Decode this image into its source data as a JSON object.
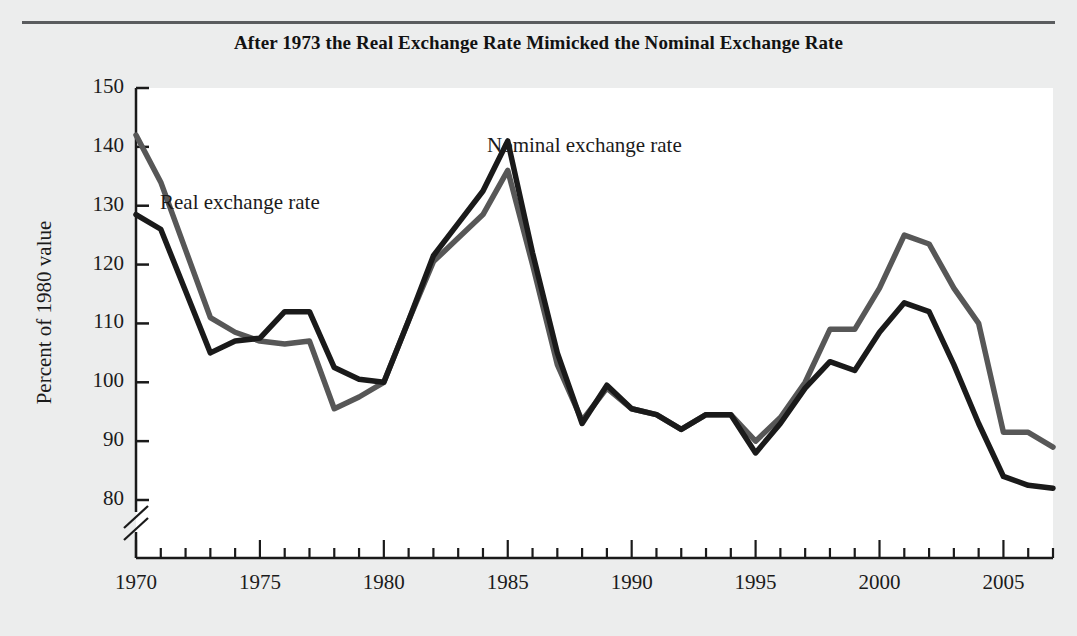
{
  "figure": {
    "title": "After 1973 the Real Exchange Rate Mimicked the Nominal Exchange Rate",
    "background_color": "#eceded",
    "plot_background_color": "#ffffff",
    "rule_color": "#5a5c5e"
  },
  "annotations": {
    "real_label": "Real exchange rate",
    "nominal_label": "Nominal exchange rate"
  },
  "chart_data": {
    "type": "line",
    "title": "After 1973 the Real Exchange Rate Mimicked the Nominal Exchange Rate",
    "xlabel": "",
    "ylabel": "Percent of 1980 value",
    "xlim": [
      1970,
      2007
    ],
    "ylim": [
      75,
      150
    ],
    "y_axis_break": true,
    "y_axis_break_below": 80,
    "grid": false,
    "legend": "inline-annotations",
    "yticks": [
      80,
      90,
      100,
      110,
      120,
      130,
      140,
      150
    ],
    "ytick_labels": [
      "80",
      "90",
      "100",
      "110",
      "120",
      "130",
      "140",
      "150"
    ],
    "xticks": [
      1970,
      1975,
      1980,
      1985,
      1990,
      1995,
      2000,
      2005
    ],
    "xtick_labels": [
      "1970",
      "1975",
      "1980",
      "1985",
      "1990",
      "1995",
      "2000",
      "2005"
    ],
    "x_minor_tick_step": 1,
    "x": [
      1970,
      1971,
      1972,
      1973,
      1974,
      1975,
      1976,
      1977,
      1978,
      1979,
      1980,
      1981,
      1982,
      1983,
      1984,
      1985,
      1986,
      1987,
      1988,
      1989,
      1990,
      1991,
      1992,
      1993,
      1994,
      1995,
      1996,
      1997,
      1998,
      1999,
      2000,
      2001,
      2002,
      2003,
      2004,
      2005,
      2006,
      2007
    ],
    "series": [
      {
        "name": "Real exchange rate",
        "color": "#575757",
        "values": [
          142.0,
          134.0,
          122.5,
          111.0,
          108.5,
          107.0,
          106.5,
          107.0,
          95.5,
          97.5,
          100.0,
          110.5,
          120.5,
          124.5,
          128.5,
          136.0,
          120.0,
          103.0,
          93.5,
          99.0,
          95.5,
          94.5,
          92.0,
          94.5,
          94.5,
          90.0,
          94.0,
          100.0,
          109.0,
          109.0,
          116.0,
          125.0,
          123.5,
          116.0,
          110.0,
          91.5,
          91.5,
          89.0
        ]
      },
      {
        "name": "Nominal exchange rate",
        "color": "#1a1a1a",
        "values": [
          128.5,
          126.0,
          115.5,
          105.0,
          107.0,
          107.5,
          112.0,
          112.0,
          102.5,
          100.5,
          100.0,
          110.5,
          121.5,
          127.0,
          132.5,
          141.0,
          122.0,
          105.0,
          93.0,
          99.5,
          95.5,
          94.5,
          92.0,
          94.5,
          94.5,
          88.0,
          93.0,
          99.0,
          103.5,
          102.0,
          108.5,
          113.5,
          112.0,
          103.0,
          93.0,
          84.0,
          82.5,
          82.0
        ]
      }
    ]
  }
}
